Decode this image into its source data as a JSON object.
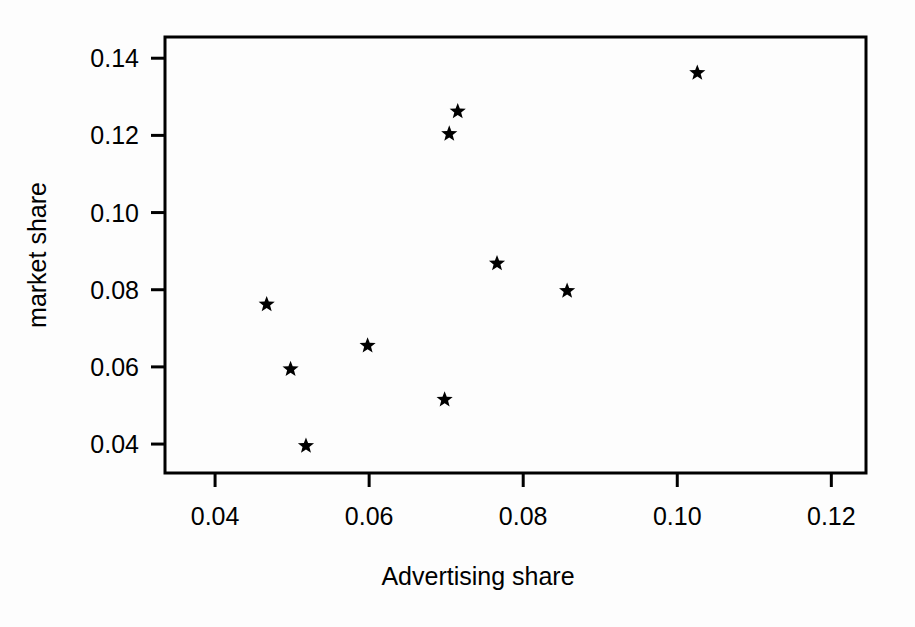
{
  "chart_data": {
    "type": "scatter",
    "title": "",
    "xlabel": "Advertising share",
    "ylabel": "market share",
    "xlim": [
      0.0335,
      0.1245
    ],
    "ylim": [
      0.0325,
      0.1455
    ],
    "xticks": [
      0.04,
      0.06,
      0.08,
      0.1,
      0.12
    ],
    "xticklabels": [
      "0.04",
      "0.06",
      "0.08",
      "0.10",
      "0.12"
    ],
    "yticks": [
      0.04,
      0.06,
      0.08,
      0.1,
      0.12,
      0.14
    ],
    "yticklabels": [
      "0.04",
      "0.06",
      "0.08",
      "0.10",
      "0.12",
      "0.14"
    ],
    "grid": false,
    "legend": false,
    "marker": "star",
    "marker_color": "#000000",
    "points": [
      {
        "x": 0.0467,
        "y": 0.0762
      },
      {
        "x": 0.0498,
        "y": 0.0594
      },
      {
        "x": 0.0518,
        "y": 0.0395
      },
      {
        "x": 0.0598,
        "y": 0.0655
      },
      {
        "x": 0.0698,
        "y": 0.0515
      },
      {
        "x": 0.0704,
        "y": 0.1204
      },
      {
        "x": 0.0715,
        "y": 0.1262
      },
      {
        "x": 0.0766,
        "y": 0.0868
      },
      {
        "x": 0.0857,
        "y": 0.0797
      },
      {
        "x": 0.1026,
        "y": 0.1362
      }
    ]
  },
  "axes": {
    "x_title": "Advertising share",
    "y_title": "market share"
  }
}
